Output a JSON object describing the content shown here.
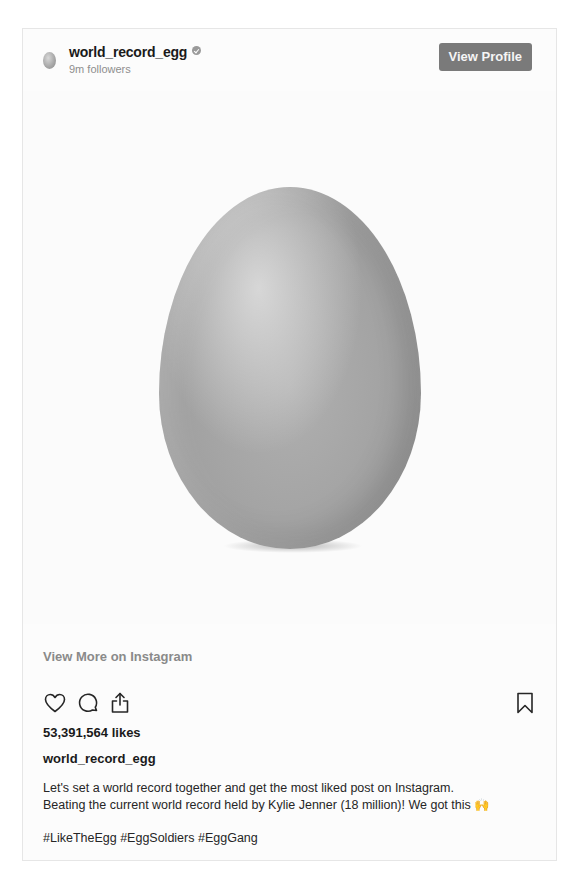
{
  "post": {
    "username": "world_record_egg",
    "followers": "9m followers",
    "view_profile_label": "View Profile",
    "view_more_label": "View More on Instagram",
    "likes": "53,391,564 likes",
    "caption_username": "world_record_egg",
    "caption_line1": "Let's set a world record together and get the most liked post on Instagram.",
    "caption_line2": "Beating the current world record held by Kylie Jenner (18 million)! We got this",
    "caption_emoji": "🙌",
    "hashtags": "#LikeTheEgg #EggSoldiers #EggGang",
    "verified": true
  },
  "icons": {
    "avatar": "egg-avatar",
    "verified": "verified-badge-icon",
    "like": "heart-icon",
    "comment": "comment-bubble-icon",
    "share": "share-icon",
    "save": "bookmark-icon"
  },
  "colors": {
    "button_bg": "#7a7a7a",
    "muted_text": "#8e8e8e",
    "text": "#262626",
    "border": "#e6e6e6"
  }
}
